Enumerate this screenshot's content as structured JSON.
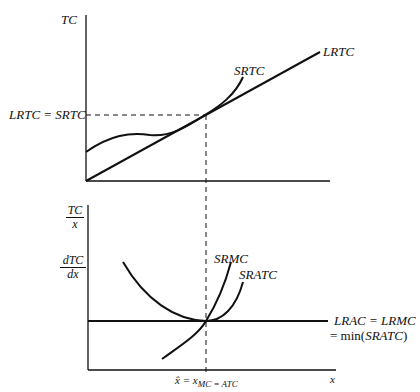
{
  "top_panel": {
    "y_axis_label": "TC",
    "tangency_label": "LRTC = SRTC",
    "curves": {
      "long_run": "LRTC",
      "short_run": "SRTC"
    }
  },
  "bottom_panel": {
    "y_axis_label_1": {
      "num": "TC",
      "den": "x"
    },
    "y_axis_label_2": {
      "num": "dTC",
      "den": "dx"
    },
    "x_axis_label": "x",
    "x_tick_label_main": "x̂ = x",
    "x_tick_label_sub": "MC = ATC",
    "curves": {
      "marginal": "SRMC",
      "average": "SRATC",
      "long_run_line1": "LRAC = LRMC",
      "long_run_line2": "= min(",
      "long_run_line2_italic": "SRATC",
      "long_run_line2_end": ")"
    }
  },
  "colors": {
    "ink": "#111111",
    "background": "#ffffff"
  }
}
